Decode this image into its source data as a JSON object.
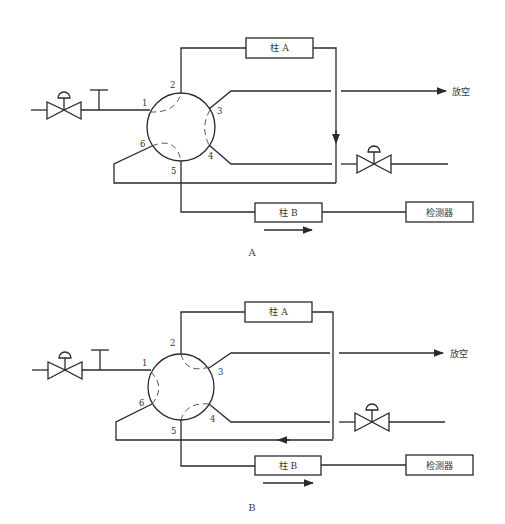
{
  "diagrams": [
    {
      "id": "A",
      "caption": "A",
      "column_a_label": "柱 A",
      "column_b_label": "柱 B",
      "detector_label": "检测器",
      "vent_label": "放空",
      "ports": [
        "1",
        "2",
        "3",
        "4",
        "5",
        "6"
      ],
      "internal_connections": [
        [
          "1",
          "2"
        ],
        [
          "3",
          "4"
        ],
        [
          "5",
          "6"
        ]
      ]
    },
    {
      "id": "B",
      "caption": "B",
      "column_a_label": "柱 A",
      "column_b_label": "柱 B",
      "detector_label": "检测器",
      "vent_label": "放空",
      "ports": [
        "1",
        "2",
        "3",
        "4",
        "5",
        "6"
      ],
      "internal_connections": [
        [
          "2",
          "3"
        ],
        [
          "4",
          "5"
        ],
        [
          "6",
          "1"
        ]
      ]
    }
  ],
  "colors": {
    "line": "#2a2a2a",
    "dashed": "#555555",
    "background": "#ffffff"
  }
}
